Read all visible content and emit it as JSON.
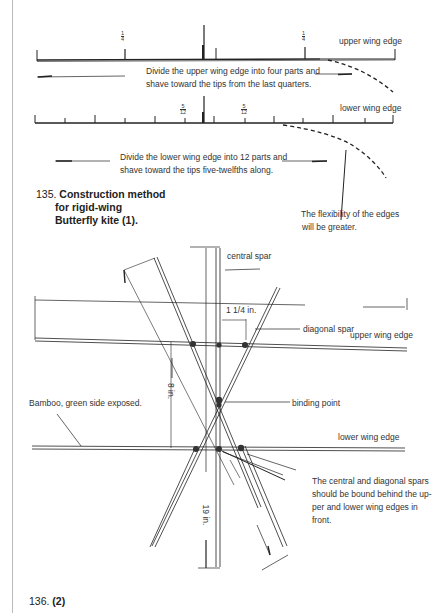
{
  "figure1": {
    "upper_label": "upper wing edge",
    "upper_fraction_left": {
      "num": "1",
      "den": "4"
    },
    "upper_fraction_right": {
      "num": "1",
      "den": "4"
    },
    "upper_text_line1": "Divide the upper wing edge into  four parts and",
    "upper_text_line2": "shave toward the  tips from the last quarters.",
    "lower_label": "lower wing edge",
    "lower_fraction_left": {
      "num": "5",
      "den": "12"
    },
    "lower_fraction_right": {
      "num": "5",
      "den": "12"
    },
    "lower_divisions": 12,
    "lower_text_line1": "Divide the lower wing edge into  12 parts and",
    "lower_text_line2": "shave toward the  tips five-twelfths along.",
    "flex_note_line1": "The  flexibility of the edges",
    "flex_note_line2": "will be  greater.",
    "caption_number": "135.",
    "caption_line1": "Construction method",
    "caption_line2": "for rigid-wing",
    "caption_line3": "Butterfly kite (1)."
  },
  "figure2": {
    "central_spar": "central spar",
    "spacing": "1 1/4 in.",
    "diagonal_spar": "diagonal spar",
    "upper_wing_edge": "upper wing edge",
    "dim_8": "8 in.",
    "bamboo_note": "Bamboo, green side exposed.",
    "binding_point": "binding point",
    "lower_wing_edge": "lower wing edge",
    "dim_19": "19 in.",
    "binding_note_line1": "The central and diagonal spars",
    "binding_note_line2": "should be bound behind the up-",
    "binding_note_line3": "per and lower wing edges in",
    "binding_note_line4": "front.",
    "caption_number": "136.",
    "caption_label": "(2)"
  }
}
